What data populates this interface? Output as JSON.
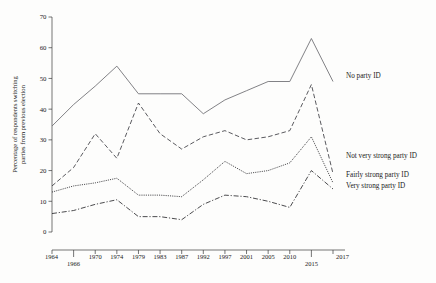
{
  "chart_data": {
    "type": "line",
    "title": "",
    "xlabel": "",
    "ylabel": "Percentage of respondents switching parties from previous election",
    "ylim": [
      0,
      70
    ],
    "yticks": [
      0,
      10,
      20,
      30,
      40,
      50,
      60,
      70
    ],
    "grid": false,
    "legend_position": "right-inline",
    "categories": [
      "1964",
      "1966",
      "1970",
      "1974",
      "1979",
      "1983",
      "1987",
      "1992",
      "1997",
      "2001",
      "2005",
      "2010",
      "2015",
      "2017"
    ],
    "series": [
      {
        "name": "No party ID",
        "style": "solid",
        "values": [
          34.5,
          41.5,
          47.5,
          54,
          45,
          45,
          45,
          38.5,
          43,
          46,
          49,
          49,
          63,
          49
        ]
      },
      {
        "name": "Not very strong party ID",
        "style": "dashed",
        "values": [
          15,
          21,
          32,
          24,
          42,
          32,
          27,
          31,
          33,
          30,
          31,
          33,
          48,
          19
        ]
      },
      {
        "name": "Fairly strong party ID",
        "style": "dotted",
        "values": [
          13,
          15,
          16,
          17.5,
          12,
          12,
          11.5,
          17,
          23,
          19,
          20,
          22.5,
          31,
          16
        ]
      },
      {
        "name": "Very strong party ID",
        "style": "dashdot",
        "values": [
          6,
          7,
          9,
          10.5,
          5,
          5,
          4,
          9,
          12,
          11.5,
          10,
          8,
          20,
          14
        ]
      }
    ]
  },
  "axes": {
    "x_label_rows": {
      "top": [
        "1964",
        "1970",
        "1974",
        "1979",
        "1983",
        "1987",
        "1992",
        "1997",
        "2001",
        "2005",
        "2010",
        "2017"
      ],
      "bottom": [
        "1966",
        "2015"
      ]
    }
  },
  "colors": {
    "axis": "#3a3a3a",
    "no_party": "#6b6b70",
    "not_very_strong": "#3c3c42",
    "fairly_strong": "#2a2a2e",
    "very_strong": "#2a2a2e",
    "background": "#fdfdfc"
  }
}
